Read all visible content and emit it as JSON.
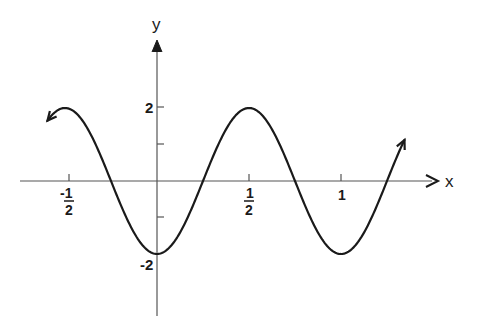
{
  "chart_data": {
    "type": "line",
    "title": "",
    "xlabel": "x",
    "ylabel": "y",
    "function": "y = -2cos(2πx)",
    "series": [
      {
        "name": "curve",
        "x": [
          -0.6,
          -0.5,
          -0.25,
          0,
          0.25,
          0.5,
          0.75,
          1,
          1.25,
          1.35
        ],
        "values": [
          1.62,
          2,
          0,
          -2,
          0,
          2,
          0,
          -2,
          0,
          1.18
        ]
      }
    ],
    "key_points": {
      "maxima": [
        [
          -0.5,
          2
        ],
        [
          0.5,
          2
        ]
      ],
      "minima": [
        [
          0,
          -2
        ],
        [
          1,
          -2
        ]
      ],
      "zeros": [
        -0.25,
        0.25,
        0.75,
        1.25
      ]
    },
    "x_ticks": [
      "-1/2",
      "1/2",
      "1"
    ],
    "x_tick_values": [
      -0.5,
      0.5,
      1
    ],
    "y_ticks": [
      "2",
      "-2"
    ],
    "y_tick_values": [
      2,
      -2
    ],
    "y_minor_ticks": [
      1,
      -1
    ],
    "xlim": [
      -0.95,
      1.55
    ],
    "ylim": [
      -3.7,
      3.7
    ],
    "grid": false,
    "legend": "none",
    "arrows": "curve continues at both ends"
  },
  "labels": {
    "x_axis": "x",
    "y_axis": "y",
    "y_tick_pos": "2",
    "y_tick_neg": "-2",
    "x_tick_neg_half_num": "-1",
    "x_tick_neg_half_den": "2",
    "x_tick_half_num": "1",
    "x_tick_half_den": "2",
    "x_tick_one": "1"
  }
}
